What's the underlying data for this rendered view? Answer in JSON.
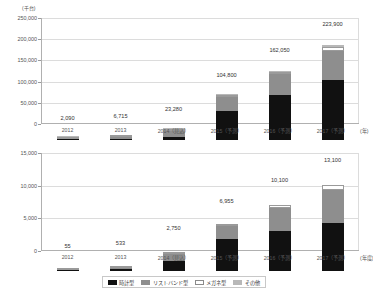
{
  "chart_data": [
    {
      "type": "bar",
      "id": "top",
      "title": "",
      "unit_label": "(千台)",
      "xlabel": "(年)",
      "ylabel": "",
      "ylim": [
        0,
        250000
      ],
      "ytick_labels": [
        "0",
        "50,000",
        "100,000",
        "150,000",
        "200,000",
        "250,000"
      ],
      "ytick_values": [
        0,
        50000,
        100000,
        150000,
        200000,
        250000
      ],
      "grid": true,
      "stacked": true,
      "legend_position": "bottom",
      "categories": [
        "2012",
        "2013",
        "2014（見込）",
        "2015（予測）",
        "2016（予測）",
        "2017（予測）"
      ],
      "totals": [
        2090,
        6715,
        23280,
        104800,
        162050,
        223900
      ],
      "total_labels": [
        "2,090",
        "6,715",
        "23,280",
        "104,800",
        "162,050",
        "223,900"
      ],
      "series": [
        {
          "name": "時計型",
          "key": "watch",
          "values": [
            300,
            1500,
            6000,
            67500,
            105000,
            142000
          ]
        },
        {
          "name": "リストバンド型",
          "key": "wrist",
          "values": [
            1600,
            4800,
            16000,
            34000,
            50000,
            67000
          ]
        },
        {
          "name": "メガネ型",
          "key": "glass",
          "values": [
            90,
            215,
            780,
            2300,
            5050,
            9900
          ]
        },
        {
          "name": "その他",
          "key": "other",
          "values": [
            100,
            200,
            500,
            1000,
            2000,
            5000
          ]
        }
      ]
    },
    {
      "type": "bar",
      "id": "bottom",
      "title": "",
      "unit_label": "",
      "xlabel": "(年度)",
      "ylabel": "",
      "ylim": [
        0,
        15000
      ],
      "ytick_labels": [
        "0",
        "5,000",
        "10,000",
        "15,000"
      ],
      "ytick_values": [
        0,
        5000,
        10000,
        15000
      ],
      "grid": true,
      "stacked": true,
      "legend_position": "bottom",
      "categories": [
        "2012",
        "2013",
        "2014（見込）",
        "2015（予測）",
        "2016（予測）",
        "2017（予測）"
      ],
      "totals": [
        55,
        533,
        2750,
        6955,
        10100,
        13100
      ],
      "total_labels": [
        "55",
        "533",
        "2,750",
        "6,955",
        "10,100",
        "13,100"
      ],
      "series": [
        {
          "name": "時計型",
          "key": "watch",
          "values": [
            20,
            330,
            1600,
            4900,
            6150,
            7350
          ]
        },
        {
          "name": "リストバンド型",
          "key": "wrist",
          "values": [
            30,
            180,
            1000,
            2000,
            3500,
            5050
          ]
        },
        {
          "name": "メガネ型",
          "key": "glass",
          "values": [
            5,
            23,
            150,
            55,
            450,
            700
          ]
        },
        {
          "name": "その他",
          "key": "other",
          "values": [
            0,
            0,
            0,
            0,
            0,
            0
          ]
        }
      ]
    }
  ],
  "legend": {
    "items": [
      {
        "label": "時計型",
        "swatch": "sw-watch"
      },
      {
        "label": "リストバンド型",
        "swatch": "sw-wrist"
      },
      {
        "label": "メガネ型",
        "swatch": "sw-glass"
      },
      {
        "label": "その他",
        "swatch": "sw-other"
      }
    ]
  }
}
